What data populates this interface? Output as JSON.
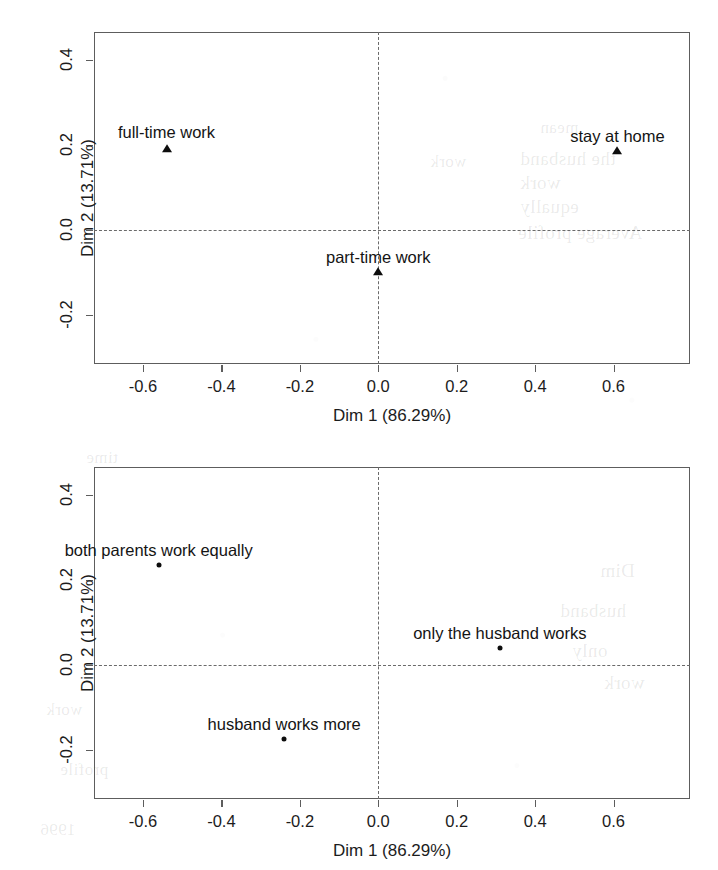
{
  "figure": {
    "background": "#ffffff",
    "ink": "#1c1c1c",
    "frame_color": "#5d5d5d",
    "bleed_through": [
      {
        "text": "the husband",
        "x": 520,
        "y": 148,
        "size": 19
      },
      {
        "text": "work",
        "x": 520,
        "y": 172,
        "size": 19
      },
      {
        "text": "equally",
        "x": 520,
        "y": 196,
        "size": 19
      },
      {
        "text": "Average profile",
        "x": 518,
        "y": 222,
        "size": 19
      },
      {
        "text": "mean",
        "x": 540,
        "y": 118,
        "size": 17
      },
      {
        "text": "work",
        "x": 430,
        "y": 152,
        "size": 17
      },
      {
        "text": "Dim",
        "x": 600,
        "y": 560,
        "size": 19
      },
      {
        "text": "husband",
        "x": 560,
        "y": 600,
        "size": 19
      },
      {
        "text": "only",
        "x": 572,
        "y": 640,
        "size": 19
      },
      {
        "text": "work",
        "x": 604,
        "y": 672,
        "size": 19
      },
      {
        "text": "time",
        "x": 86,
        "y": 448,
        "size": 17
      },
      {
        "text": "1996",
        "x": 40,
        "y": 820,
        "size": 17
      },
      {
        "text": "work",
        "x": 46,
        "y": 700,
        "size": 17
      },
      {
        "text": "profile",
        "x": 60,
        "y": 760,
        "size": 17
      }
    ]
  },
  "chart_data": [
    {
      "id": "mca-variable-categories",
      "type": "scatter",
      "title": "",
      "xlabel": "Dim 1 (86.29%)",
      "ylabel": "Dim 2 (13.71%)",
      "xlim": [
        -0.725,
        0.795
      ],
      "ylim": [
        -0.315,
        0.465
      ],
      "xticks": [
        -0.6,
        -0.4,
        -0.2,
        0.0,
        0.2,
        0.4,
        0.6
      ],
      "xticklabels": [
        "-0.6",
        "-0.4",
        "-0.2",
        "0.0",
        "0.2",
        "0.4",
        "0.6"
      ],
      "yticks": [
        -0.2,
        0.0,
        0.2,
        0.4
      ],
      "yticklabels": [
        "-0.2",
        "0.0",
        "0.2",
        "0.4"
      ],
      "grid": false,
      "reference_lines": {
        "hline": 0.0,
        "vline": 0.0,
        "style": "dashed"
      },
      "marker": "triangle",
      "points": [
        {
          "label": "full-time work",
          "x": -0.54,
          "y": 0.19,
          "label_dy": -0.055,
          "label_align": "center"
        },
        {
          "label": "stay at home",
          "x": 0.61,
          "y": 0.185,
          "label_dy": 0.046,
          "label_align": "center"
        },
        {
          "label": "part-time work",
          "x": 0.0,
          "y": -0.1,
          "label_dy": 0.046,
          "label_align": "center"
        }
      ]
    },
    {
      "id": "mca-individual-categories",
      "type": "scatter",
      "title": "",
      "xlabel": "Dim 1 (86.29%)",
      "ylabel": "Dim 2 (13.71%)",
      "xlim": [
        -0.725,
        0.795
      ],
      "ylim": [
        -0.315,
        0.465
      ],
      "xticks": [
        -0.6,
        -0.4,
        -0.2,
        0.0,
        0.2,
        0.4,
        0.6
      ],
      "xticklabels": [
        "-0.6",
        "-0.4",
        "-0.2",
        "0.0",
        "0.2",
        "0.4",
        "0.6"
      ],
      "yticks": [
        -0.2,
        0.0,
        0.2,
        0.4
      ],
      "yticklabels": [
        "-0.2",
        "0.0",
        "0.2",
        "0.4"
      ],
      "grid": false,
      "reference_lines": {
        "hline": 0.0,
        "vline": 0.0,
        "style": "dashed"
      },
      "marker": "dot",
      "points": [
        {
          "label": "both parents work equally",
          "x": -0.56,
          "y": 0.235,
          "label_dy": 0.046,
          "label_align": "center"
        },
        {
          "label": "only the husband works",
          "x": 0.31,
          "y": 0.04,
          "label_dy": 0.046,
          "label_align": "center"
        },
        {
          "label": "husband works more",
          "x": -0.24,
          "y": -0.175,
          "label_dy": 0.046,
          "label_align": "center"
        }
      ]
    }
  ]
}
